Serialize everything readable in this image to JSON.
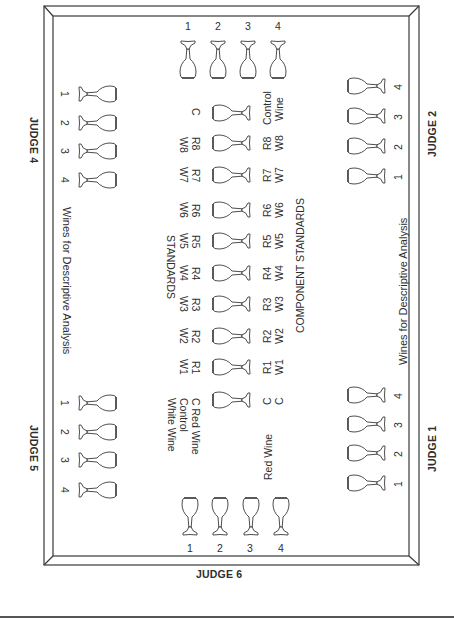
{
  "diagram": {
    "type": "wine-tasting-table-layout",
    "judges": {
      "judge1": "JUDGE 1",
      "judge2": "JUDGE 2",
      "judge4": "JUDGE 4",
      "judge5": "JUDGE 5",
      "judge6": "JUDGE 6"
    },
    "glass_numbers": [
      "1",
      "2",
      "3",
      "4"
    ],
    "wines_for_descriptive_analysis": "Wines for Descriptive Analysis",
    "component_standards_title": "COMPONENT STANDARDS",
    "standards_title": "STANDARDS",
    "center_column": {
      "right_labels": [
        {
          "top": "Control",
          "bottom": "Wine"
        },
        {
          "top": "R8",
          "bottom": "W8"
        },
        {
          "top": "R7",
          "bottom": "W7"
        },
        {
          "top": "R6",
          "bottom": "W6"
        },
        {
          "top": "R5",
          "bottom": "W5"
        },
        {
          "top": "R4",
          "bottom": "W4"
        },
        {
          "top": "R3",
          "bottom": "W3"
        },
        {
          "top": "R2",
          "bottom": "W2"
        },
        {
          "top": "R1",
          "bottom": "W1"
        },
        {
          "top": "C",
          "bottom": "C"
        }
      ],
      "left_labels": [
        {
          "a": "C",
          "b": ""
        },
        {
          "a": "R8",
          "b": "W8"
        },
        {
          "a": "R7",
          "b": "W7"
        },
        {
          "a": "R6",
          "b": "W6"
        },
        {
          "a": "R5",
          "b": "W5"
        },
        {
          "a": "R4",
          "b": "W4"
        },
        {
          "a": "R3",
          "b": "W3"
        },
        {
          "a": "R2",
          "b": "W2"
        },
        {
          "a": "R1",
          "b": "W1"
        }
      ],
      "control_legend": {
        "line1": "C Red Wine",
        "line2": "Control",
        "line3": "White Wine"
      },
      "red_wine_label": "Red Wine"
    }
  }
}
